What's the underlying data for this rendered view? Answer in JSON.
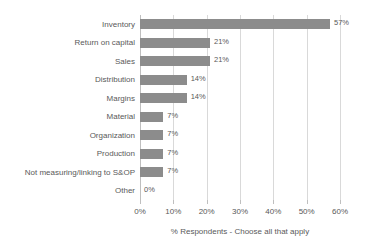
{
  "chart_data": {
    "type": "bar",
    "orientation": "horizontal",
    "title": "",
    "xlabel": "% Respondents - Choose all that apply",
    "ylabel": "",
    "xlim": [
      0,
      60
    ],
    "xtick_labels": [
      "0%",
      "10%",
      "20%",
      "30%",
      "40%",
      "50%",
      "60%"
    ],
    "xticks": [
      0,
      10,
      20,
      30,
      40,
      50,
      60
    ],
    "grid": true,
    "legend": false,
    "categories": [
      "Inventory",
      "Return on capital",
      "Sales",
      "Distribution",
      "Margins",
      "Material",
      "Organization",
      "Production",
      "Not measuring/linking to S&OP",
      "Other"
    ],
    "values": [
      57,
      21,
      21,
      14,
      14,
      7,
      7,
      7,
      7,
      0
    ],
    "data_labels": [
      "57%",
      "21%",
      "21%",
      "14%",
      "14%",
      "7%",
      "7%",
      "7%",
      "7%",
      "0%"
    ],
    "colors": {
      "bar": "#8c8c8c",
      "text": "#595959",
      "gridline": "#d9d9d9",
      "axis": "#bfbfbf",
      "background": "#ffffff"
    }
  }
}
